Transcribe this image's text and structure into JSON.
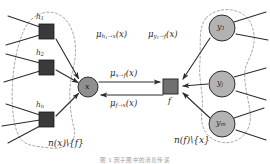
{
  "figure": {
    "background_color": "#ffffff",
    "variable_node_fill": "#b3b3b3",
    "factor_node_fill": "#3a3a3a",
    "stroke_color": "#2b2b2b",
    "dashed_color": "#9a9a9a"
  },
  "left_nodes": [
    {
      "id": "h1",
      "label_base": "h",
      "label_sub": "1",
      "shape": "square-filled",
      "x": 46,
      "y": 31
    },
    {
      "id": "h2",
      "label_base": "h",
      "label_sub": "2",
      "shape": "square-filled",
      "x": 46,
      "y": 67
    },
    {
      "id": "hn",
      "label_base": "h",
      "label_sub": "n",
      "shape": "square-filled",
      "x": 46,
      "y": 120
    }
  ],
  "right_nodes": [
    {
      "id": "y1",
      "label_base": "y",
      "label_sub": "1",
      "shape": "circle-filled",
      "x": 224,
      "y": 28
    },
    {
      "id": "yj",
      "label_base": "y",
      "label_sub": "j",
      "shape": "circle-filled",
      "x": 224,
      "y": 84
    },
    {
      "id": "ym",
      "label_base": "y",
      "label_sub": "m",
      "shape": "circle-filled",
      "x": 224,
      "y": 124
    }
  ],
  "center_nodes": [
    {
      "id": "x",
      "label": "x",
      "shape": "circle-filled",
      "x": 88,
      "y": 86
    },
    {
      "id": "f",
      "label": "f",
      "shape": "square-filled",
      "x": 171,
      "y": 86
    }
  ],
  "messages": {
    "h1_to_x": {
      "base": "μ",
      "sub_from": "h",
      "sub_from_idx": "1",
      "sub_arrow": "→",
      "sub_to": "x",
      "arg": "(x)",
      "x": 98,
      "y": 34
    },
    "x_to_f": {
      "base": "μ",
      "sub_from": "x",
      "sub_arrow": "→",
      "sub_to": "f",
      "arg": "(x)",
      "x": 112,
      "y": 72
    },
    "f_to_x": {
      "base": "μ",
      "sub_from": "f",
      "sub_arrow": "→",
      "sub_to": "x",
      "arg": "(x)",
      "x": 112,
      "y": 104
    },
    "y1_to_f": {
      "base": "μ",
      "sub_from": "y",
      "sub_from_idx": "1",
      "sub_arrow": "→",
      "sub_to": "f",
      "arg": "(x)",
      "x": 150,
      "y": 34
    }
  },
  "set_labels": {
    "left": {
      "text": "n(x)\\{f}",
      "x": 48,
      "y": 144
    },
    "right": {
      "text": "n(f)\\{x}",
      "x": 175,
      "y": 141
    }
  },
  "caption": {
    "text": "图 1  因子图中的消息传递"
  }
}
